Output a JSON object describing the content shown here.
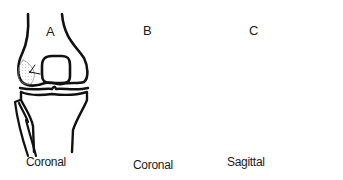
{
  "figure": {
    "panels": [
      {
        "id": "A",
        "letter": "A",
        "caption": "Coronal"
      },
      {
        "id": "B",
        "letter": "B",
        "caption": "Coronal"
      },
      {
        "id": "C",
        "letter": "C",
        "caption": "Sagittal"
      }
    ]
  },
  "colors": {
    "stroke": "#111111",
    "dots": "#9a9a9a",
    "background": "#ffffff"
  }
}
